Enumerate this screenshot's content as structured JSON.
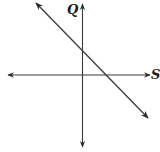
{
  "diagram": {
    "type": "coordinate-axes-with-line",
    "axes": {
      "vertical_label": "Q",
      "horizontal_label": "S"
    },
    "line": {
      "description": "straight line with negative slope, arrows at both ends",
      "slope_sign": "negative",
      "intercepts_positive_vertical_axis": true,
      "intercepts_positive_horizontal_axis": true
    },
    "colors": {
      "stroke": "#3a3a3a",
      "label": "#1a1a1a",
      "background": "#ffffff"
    }
  }
}
